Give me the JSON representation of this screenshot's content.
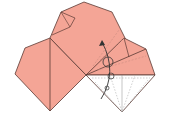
{
  "diagram": {
    "type": "origami-fold-step",
    "colors": {
      "paper_front": "#f4a596",
      "paper_back": "#ffffff",
      "edge": "#5a3a34",
      "dashed": "#c98c80",
      "dashed_white": "#b0b0b0",
      "arrow": "#333333"
    },
    "symbols": [
      "fold-arrow-curved",
      "rotate-circle-large",
      "rotate-circle-small",
      "rotate-circle-tiny"
    ]
  }
}
